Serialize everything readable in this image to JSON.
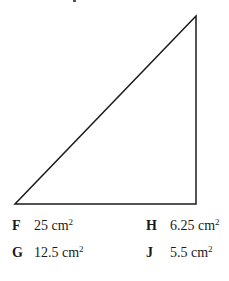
{
  "diagram": {
    "shape": "right-triangle",
    "vertices": {
      "top": [
        196,
        16
      ],
      "bottom_left": [
        15,
        204
      ],
      "bottom_right": [
        196,
        204
      ]
    },
    "stroke_color": "#1a1a1a"
  },
  "choices": [
    {
      "letter": "F",
      "value": "25 cm",
      "unit_exp": "2"
    },
    {
      "letter": "H",
      "value": "6.25 cm",
      "unit_exp": "2"
    },
    {
      "letter": "G",
      "value": "12.5 cm",
      "unit_exp": "2"
    },
    {
      "letter": "J",
      "value": "5.5 cm",
      "unit_exp": "2"
    }
  ]
}
